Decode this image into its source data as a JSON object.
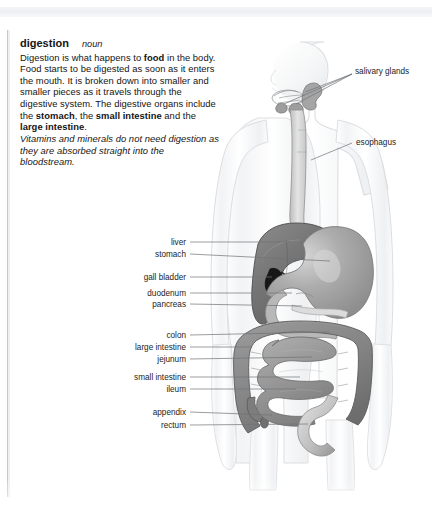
{
  "page": {
    "headword": "digestion",
    "part_of_speech": "noun",
    "definition_runs": [
      {
        "t": "Digestion is what happens to ",
        "b": false
      },
      {
        "t": "food",
        "b": true
      },
      {
        "t": " in the body. Food starts to be digested as soon as it enters the mouth. It is broken down into smaller and smaller pieces as it travels through the digestive system. The digestive organs include the ",
        "b": false
      },
      {
        "t": "stomach",
        "b": true
      },
      {
        "t": ", the ",
        "b": false
      },
      {
        "t": "small intestine",
        "b": true
      },
      {
        "t": " and the ",
        "b": false
      },
      {
        "t": "large intestine",
        "b": true
      },
      {
        "t": ".",
        "b": false
      }
    ],
    "note": "Vitamins and minerals do not need digestion as they are absorbed straight into the bloodstream."
  },
  "diagram": {
    "labels_right": [
      {
        "id": "salivary-glands",
        "text": "salivary glands",
        "x": 355,
        "y": 71,
        "line": [
          [
            352,
            74
          ],
          [
            305,
            92
          ]
        ]
      },
      {
        "id": "esophagus",
        "text": "esophagus",
        "x": 356,
        "y": 142,
        "line": [
          [
            352,
            143
          ],
          [
            311,
            158
          ]
        ]
      }
    ],
    "labels_left": [
      {
        "id": "liver",
        "text": "liver",
        "x": 186,
        "y": 242,
        "line": [
          [
            190,
            242
          ],
          [
            290,
            242
          ]
        ]
      },
      {
        "id": "stomach",
        "text": "stomach",
        "x": 186,
        "y": 254,
        "line": [
          [
            190,
            254
          ],
          [
            330,
            261
          ]
        ]
      },
      {
        "id": "gall-bladder",
        "text": "gall bladder",
        "x": 186,
        "y": 277,
        "line": [
          [
            190,
            277
          ],
          [
            272,
            277
          ]
        ]
      },
      {
        "id": "duodenum",
        "text": "duodenum",
        "x": 186,
        "y": 293,
        "line": [
          [
            190,
            293
          ],
          [
            290,
            293
          ]
        ]
      },
      {
        "id": "pancreas",
        "text": "pancreas",
        "x": 186,
        "y": 304,
        "line": [
          [
            190,
            304
          ],
          [
            300,
            304
          ]
        ]
      },
      {
        "id": "colon",
        "text": "colon",
        "x": 186,
        "y": 335,
        "line": [
          [
            190,
            335
          ],
          [
            330,
            335
          ]
        ]
      },
      {
        "id": "large-intestine",
        "text": "large intestine",
        "x": 186,
        "y": 347,
        "line": [
          [
            190,
            347
          ],
          [
            250,
            347
          ]
        ]
      },
      {
        "id": "jejunum",
        "text": "jejunum",
        "x": 186,
        "y": 359,
        "line": [
          [
            190,
            359
          ],
          [
            310,
            359
          ]
        ]
      },
      {
        "id": "small-intestine",
        "text": "small intestine",
        "x": 186,
        "y": 377,
        "line": [
          [
            190,
            377
          ],
          [
            300,
            377
          ]
        ]
      },
      {
        "id": "ileum",
        "text": "ileum",
        "x": 186,
        "y": 389,
        "line": [
          [
            190,
            389
          ],
          [
            295,
            389
          ]
        ]
      },
      {
        "id": "appendix",
        "text": "appendix",
        "x": 186,
        "y": 412,
        "line": [
          [
            190,
            412
          ],
          [
            280,
            412
          ]
        ]
      },
      {
        "id": "rectum",
        "text": "rectum",
        "x": 186,
        "y": 425,
        "line": [
          [
            190,
            425
          ],
          [
            305,
            425
          ]
        ]
      }
    ],
    "colors": {
      "body_outline": "#d8dadd",
      "body_fill": "#fdfdfd",
      "liver": "#7b7b7b",
      "stomach": "#a9a9a9",
      "gall_bladder": "#181818",
      "large_intestine": "#8c8c8c",
      "small_intestine": "#9a9a9a",
      "esophagus": "#c2c2c2",
      "leader_line": "#6f7276",
      "label_text": "#1c1c1c"
    }
  }
}
